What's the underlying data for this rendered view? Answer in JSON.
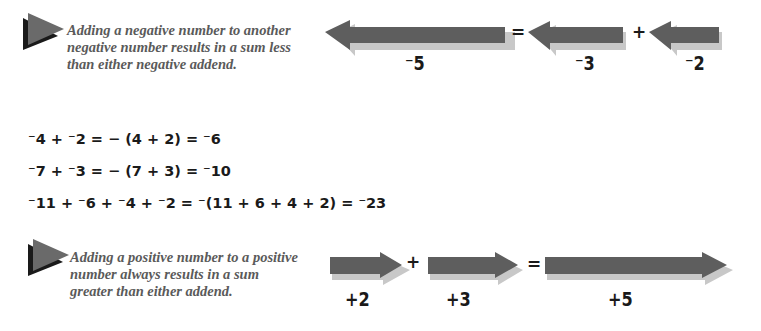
{
  "negative_section": {
    "note": "Adding a negative number to another negative number results in a sum less than either negative addend.",
    "diagram": {
      "arrows": [
        {
          "label": "⁻5",
          "value": -5
        },
        {
          "label": "⁻3",
          "value": -3
        },
        {
          "label": "⁻2",
          "value": -2
        }
      ],
      "equals": "=",
      "plus": "+"
    }
  },
  "equations": [
    "⁻4 + ⁻2 = − (4 + 2) = ⁻6",
    "⁻7 + ⁻3 = − (7 + 3) = ⁻10",
    "⁻11 + ⁻6 + ⁻4 + ⁻2 = ⁻(11 + 6 + 4 + 2) = ⁻23"
  ],
  "positive_section": {
    "note": "Adding a positive number to a positive number always results in a sum greater than either addend.",
    "diagram": {
      "arrows": [
        {
          "label": "+2",
          "value": 2
        },
        {
          "label": "+3",
          "value": 3
        },
        {
          "label": "+5",
          "value": 5
        }
      ],
      "plus": "+",
      "equals": "="
    }
  },
  "colors": {
    "arrow": "#5e5e5e",
    "arrow_shadow": "#c8c8c8",
    "bullet": "#6a6a6a",
    "bullet_shadow": "#1a1a1a",
    "note_text": "#5a5a5a"
  }
}
